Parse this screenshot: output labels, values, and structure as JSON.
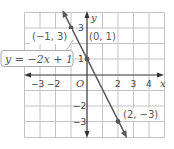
{
  "graph": {
    "equation": "y = −2x + 1",
    "x_axis_label": "x",
    "y_axis_label": "y",
    "origin_label": "O",
    "x_ticks": [
      {
        "value": -3,
        "label": "−3"
      },
      {
        "value": -2,
        "label": "−2"
      },
      {
        "value": 2,
        "label": "2"
      },
      {
        "value": 3,
        "label": "3"
      },
      {
        "value": 4,
        "label": "4"
      }
    ],
    "y_ticks": [
      {
        "value": 3,
        "label": "3"
      },
      {
        "value": 1,
        "label": "1"
      },
      {
        "value": -2,
        "label": "−2"
      },
      {
        "value": -3,
        "label": "−3"
      }
    ],
    "points": [
      {
        "x": -1,
        "y": 3,
        "label": "(−1, 3)"
      },
      {
        "x": 0,
        "y": 1,
        "label": "(0, 1)"
      },
      {
        "x": 2,
        "y": -3,
        "label": "(2, −3)"
      }
    ],
    "x_range": [
      -4,
      5
    ],
    "y_range": [
      -4,
      4
    ],
    "colors": {
      "grid": "#c4c4c4",
      "axis": "#333333",
      "line": "#5a5a5a",
      "point": "#555555"
    }
  }
}
